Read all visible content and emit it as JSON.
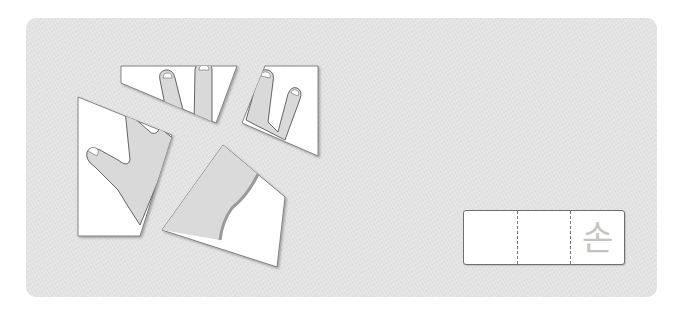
{
  "activity": {
    "type": "hand-puzzle-word-card",
    "pieces": [
      {
        "id": "fingers-middle-index",
        "label": "hand piece: two fingers"
      },
      {
        "id": "fingers-ring-pinky",
        "label": "hand piece: two fingers"
      },
      {
        "id": "thumb-palm",
        "label": "hand piece: thumb and palm"
      },
      {
        "id": "wrist",
        "label": "hand piece: wrist"
      }
    ]
  },
  "answer_box": {
    "cells": [
      "",
      "",
      "손"
    ],
    "glyph_color": "#c4c4c4"
  },
  "colors": {
    "panel": "#e2e2e2",
    "skin_shade": "#d8d8d8",
    "outline": "#6a6a6a"
  }
}
